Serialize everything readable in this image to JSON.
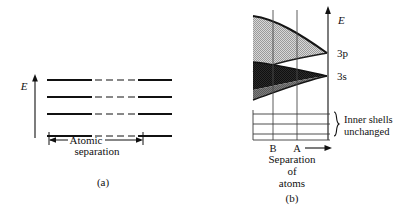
{
  "figure": {
    "type": "physics-energy-band-diagram",
    "background": "#ffffff",
    "ink": "#111111"
  },
  "panel_a": {
    "caption": "(a)",
    "axis_label": "E",
    "axis": {
      "name": "energy-axis",
      "direction": "up",
      "x": 35,
      "y_top": 76,
      "y_bottom": 138
    },
    "levels_label_line1": "Atomic",
    "levels_label_line2": "separation",
    "level_count": 4,
    "levels_y": [
      80,
      97,
      114,
      136
    ],
    "segment_style": "solid segments joined by dashed gaps",
    "span_x": [
      47,
      145
    ],
    "arrow_label": "Atomic separation",
    "arrow_y": 140
  },
  "panel_b": {
    "caption": "(b)",
    "axis_label": "E",
    "axis": {
      "name": "energy-axis",
      "direction": "up",
      "x": 328,
      "y_top": 8,
      "y_bottom": 140
    },
    "band_labels": {
      "upper": "3p",
      "lower": "3s"
    },
    "bands": [
      {
        "name": "3p-band",
        "label": "3p",
        "color": "#b9b9b9",
        "edge_color": "#1a1a1a",
        "converge_y": 53,
        "left_top_y": 16,
        "left_bottom_y": 72,
        "description": "upper conduction band flaring upward to the left"
      },
      {
        "name": "3s-band",
        "label": "3s",
        "color": "#2a2a2a",
        "secondary_color": "#6e6e6e",
        "edge_color": "#111111",
        "converge_y": 76,
        "left_top_y": 62,
        "left_bottom_y": 100,
        "description": "lower valence band, dark, splitting to the left"
      }
    ],
    "guide_lines": [
      {
        "name": "guide-line-B",
        "label": "B",
        "x": 273
      },
      {
        "name": "guide-line-A",
        "label": "A",
        "x": 297
      }
    ],
    "inner_shells": {
      "label_line1": "Inner shells",
      "label_line2": "unchanged",
      "brace": "}",
      "line_count": 3,
      "lines_y": [
        114,
        124,
        134
      ],
      "x_start": 253,
      "x_end": 330
    },
    "baseline_y": 140,
    "baseline_x": [
      253,
      330
    ],
    "x_axis_label_line1": "Separation",
    "x_axis_label_line2": "of",
    "x_axis_label_line3": "atoms",
    "x_axis_arrow": true
  }
}
